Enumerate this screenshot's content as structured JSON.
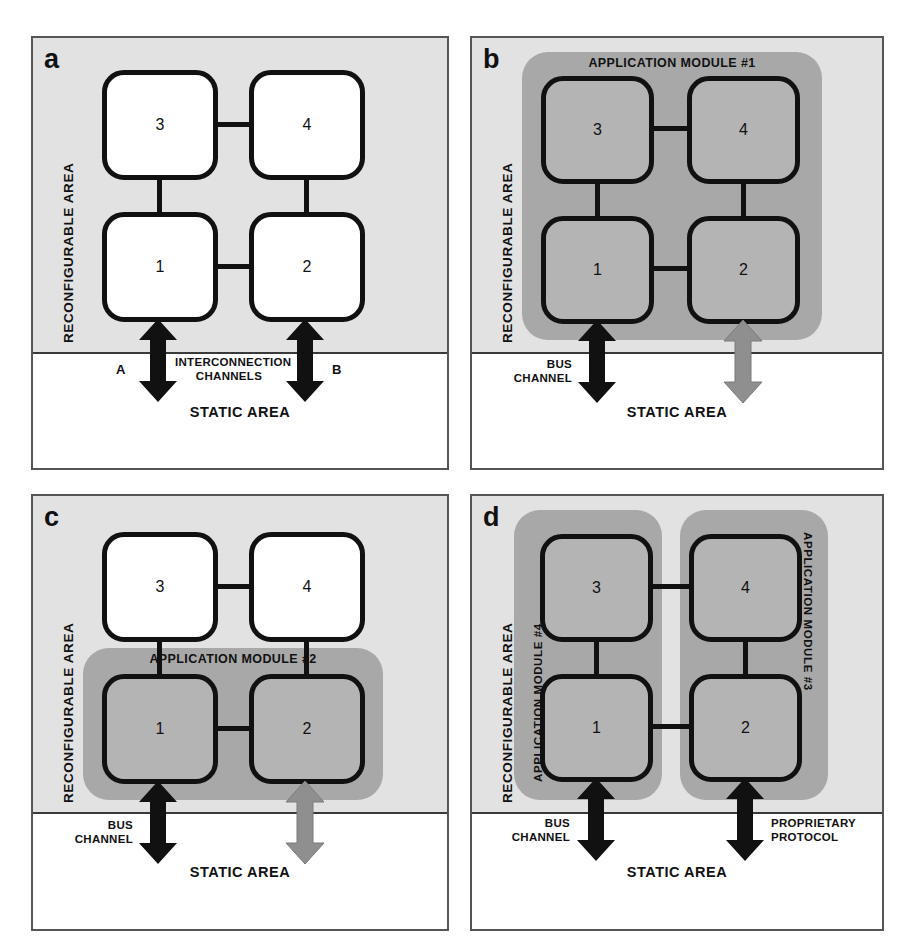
{
  "figure": {
    "panels": [
      {
        "letter": "a",
        "reconfigurable_label": "RECONFIGURABLE AREA",
        "static_label": "STATIC AREA",
        "blocks": [
          {
            "id": "1",
            "label": "1",
            "shaded": false
          },
          {
            "id": "2",
            "label": "2",
            "shaded": false
          },
          {
            "id": "3",
            "label": "3",
            "shaded": false
          },
          {
            "id": "4",
            "label": "4",
            "shaded": false
          }
        ],
        "modules": [],
        "channels": [
          {
            "name": "channel-a",
            "color": "#111111",
            "label": "",
            "endpoint_label": "A"
          },
          {
            "name": "channel-b",
            "color": "#111111",
            "label": "",
            "endpoint_label": "B"
          }
        ],
        "center_channel_label_line1": "INTERCONNECTION",
        "center_channel_label_line2": "CHANNELS"
      },
      {
        "letter": "b",
        "reconfigurable_label": "RECONFIGURABLE AREA",
        "static_label": "STATIC AREA",
        "blocks": [
          {
            "id": "1",
            "label": "1",
            "shaded": true
          },
          {
            "id": "2",
            "label": "2",
            "shaded": true
          },
          {
            "id": "3",
            "label": "3",
            "shaded": true
          },
          {
            "id": "4",
            "label": "4",
            "shaded": true
          }
        ],
        "modules": [
          {
            "name": "application-module-1",
            "label": "APPLICATION MODULE #1",
            "orientation": "top",
            "covers": [
              "1",
              "2",
              "3",
              "4"
            ]
          }
        ],
        "channels": [
          {
            "name": "bus-channel",
            "color": "#111111",
            "label_line1": "BUS",
            "label_line2": "CHANNEL"
          },
          {
            "name": "inactive-channel",
            "color": "#8f8f8f",
            "label_line1": "",
            "label_line2": ""
          }
        ]
      },
      {
        "letter": "c",
        "reconfigurable_label": "RECONFIGURABLE AREA",
        "static_label": "STATIC AREA",
        "blocks": [
          {
            "id": "1",
            "label": "1",
            "shaded": true
          },
          {
            "id": "2",
            "label": "2",
            "shaded": true
          },
          {
            "id": "3",
            "label": "3",
            "shaded": false
          },
          {
            "id": "4",
            "label": "4",
            "shaded": false
          }
        ],
        "modules": [
          {
            "name": "application-module-2",
            "label": "APPLICATION MODULE #2",
            "orientation": "top",
            "covers": [
              "1",
              "2"
            ]
          }
        ],
        "channels": [
          {
            "name": "bus-channel",
            "color": "#111111",
            "label_line1": "BUS",
            "label_line2": "CHANNEL"
          },
          {
            "name": "inactive-channel",
            "color": "#8f8f8f",
            "label_line1": "",
            "label_line2": ""
          }
        ]
      },
      {
        "letter": "d",
        "reconfigurable_label": "RECONFIGURABLE AREA",
        "static_label": "STATIC AREA",
        "blocks": [
          {
            "id": "1",
            "label": "1",
            "shaded": true
          },
          {
            "id": "2",
            "label": "2",
            "shaded": true
          },
          {
            "id": "3",
            "label": "3",
            "shaded": true
          },
          {
            "id": "4",
            "label": "4",
            "shaded": true
          }
        ],
        "modules": [
          {
            "name": "application-module-4",
            "label": "APPLICATION MODULE #4",
            "orientation": "left",
            "covers": [
              "1",
              "3"
            ]
          },
          {
            "name": "application-module-3",
            "label": "APPLICATION MODULE #3",
            "orientation": "right",
            "covers": [
              "2",
              "4"
            ]
          }
        ],
        "channels": [
          {
            "name": "bus-channel",
            "color": "#111111",
            "label_line1": "BUS",
            "label_line2": "CHANNEL"
          },
          {
            "name": "proprietary-protocol-channel",
            "color": "#111111",
            "label_line1": "PROPRIETARY",
            "label_line2": "PROTOCOL"
          }
        ]
      }
    ],
    "colors": {
      "reconfigurable_area_fill": "#e2e2e2",
      "static_area_fill": "#ffffff",
      "module_fill": "#a8a8a8",
      "shaded_block_fill": "#b4b4b4",
      "plain_block_fill": "#ffffff",
      "block_outline": "#111111",
      "active_arrow": "#111111",
      "inactive_arrow": "#8f8f8f"
    }
  }
}
